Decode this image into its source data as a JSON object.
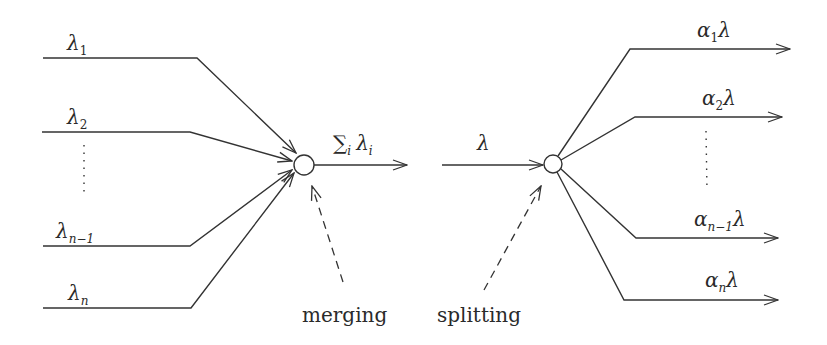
{
  "diagram": {
    "colors": {
      "stroke": "#333333",
      "background": "#ffffff"
    },
    "merging": {
      "inputs": [
        {
          "symbol": "λ",
          "subscript": "1"
        },
        {
          "symbol": "λ",
          "subscript": "2"
        },
        {
          "symbol": "λ",
          "subscript": "n−1"
        },
        {
          "symbol": "λ",
          "subscript": "n"
        }
      ],
      "output": {
        "sum_symbol": "∑",
        "sum_index": "i",
        "symbol": "λ",
        "subscript": "i"
      },
      "caption": "merging"
    },
    "splitting": {
      "input": {
        "symbol": "λ"
      },
      "outputs": [
        {
          "coef": "α",
          "subscript": "1",
          "symbol": "λ"
        },
        {
          "coef": "α",
          "subscript": "2",
          "symbol": "λ"
        },
        {
          "coef": "α",
          "subscript": "n−1",
          "symbol": "λ"
        },
        {
          "coef": "α",
          "subscript": "n",
          "symbol": "λ"
        }
      ],
      "caption": "splitting"
    }
  }
}
